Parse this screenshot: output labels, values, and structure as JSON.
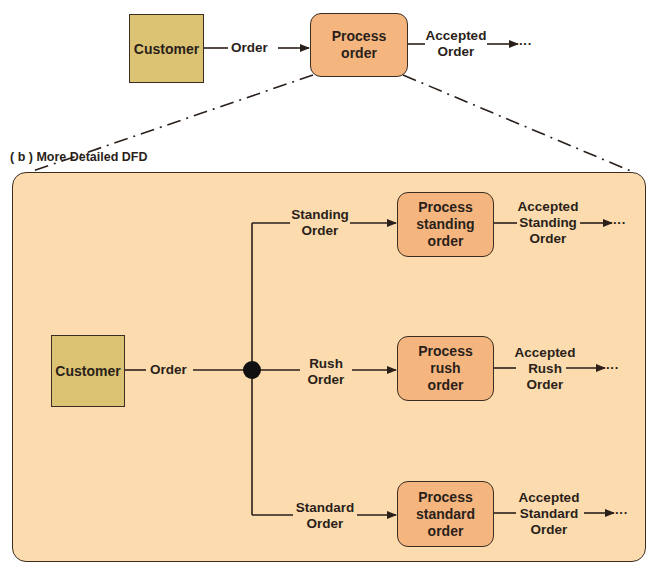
{
  "top_diagram": {
    "entity": {
      "label": "Customer"
    },
    "flow_in": {
      "label": "Order"
    },
    "process": {
      "line1": "Process",
      "line2": "order"
    },
    "flow_out": {
      "line1": "Accepted",
      "line2": "Order",
      "continuation": "···"
    }
  },
  "detail_panel": {
    "caption": "( b ) More Detailed DFD",
    "entity": {
      "label": "Customer"
    },
    "flow_in": {
      "label": "Order"
    },
    "branches": [
      {
        "flow_in": {
          "line1": "Standing",
          "line2": "Order"
        },
        "process": {
          "line1": "Process",
          "line2": "standing",
          "line3": "order"
        },
        "flow_out": {
          "line1": "Accepted",
          "line2": "Standing",
          "line3": "Order",
          "continuation": "···"
        }
      },
      {
        "flow_in": {
          "line1": "Rush",
          "line2": "Order"
        },
        "process": {
          "line1": "Process",
          "line2": "rush",
          "line3": "order"
        },
        "flow_out": {
          "line1": "Accepted",
          "line2": "Rush",
          "line3": "Order",
          "continuation": "···"
        }
      },
      {
        "flow_in": {
          "line1": "Standard",
          "line2": "Order"
        },
        "process": {
          "line1": "Process",
          "line2": "standard",
          "line3": "order"
        },
        "flow_out": {
          "line1": "Accepted",
          "line2": "Standard",
          "line3": "Order",
          "continuation": "···"
        }
      }
    ]
  },
  "colors": {
    "entity_fill": "#dcc373",
    "process_fill": "#f5b57f",
    "panel_fill": "#fcdcae",
    "stroke": "#3a2e24"
  }
}
